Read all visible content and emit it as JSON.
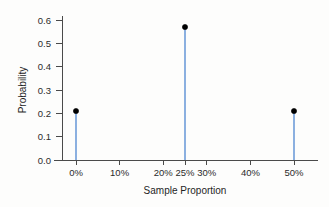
{
  "chart_data": {
    "type": "scatter",
    "subtype": "stem-lollipop",
    "title": "",
    "subtitle": "",
    "xlabel": "Sample Proportion",
    "ylabel": "Probability",
    "x": [
      0,
      25,
      50
    ],
    "values": [
      0.21,
      0.57,
      0.21
    ],
    "points": [
      {
        "x": 0,
        "x_label": "0%",
        "y": 0.21
      },
      {
        "x": 25,
        "x_label": "25%",
        "y": 0.57
      },
      {
        "x": 50,
        "x_label": "50%",
        "y": 0.21
      }
    ],
    "xlim": [
      -3,
      53
    ],
    "ylim": [
      0.0,
      0.63
    ],
    "x_ticks": [
      0,
      10,
      20,
      25,
      30,
      40,
      50
    ],
    "x_tick_labels": [
      "0%",
      "10%",
      "20%",
      "25%",
      "30%",
      "40%",
      "50%"
    ],
    "y_ticks": [
      0.0,
      0.1,
      0.2,
      0.3,
      0.4,
      0.5,
      0.6
    ],
    "y_tick_labels": [
      "0.0",
      "0.1",
      "0.2",
      "0.3",
      "0.4",
      "0.5",
      "0.6"
    ],
    "grid": false,
    "legend": null,
    "legend_position": "none",
    "annotations": [],
    "colors": {
      "stem": "#5b8fd4",
      "marker": "#000000",
      "axis": "#4a4a4a",
      "text": "#1f1f1f",
      "background": "#fdfdfc"
    }
  }
}
